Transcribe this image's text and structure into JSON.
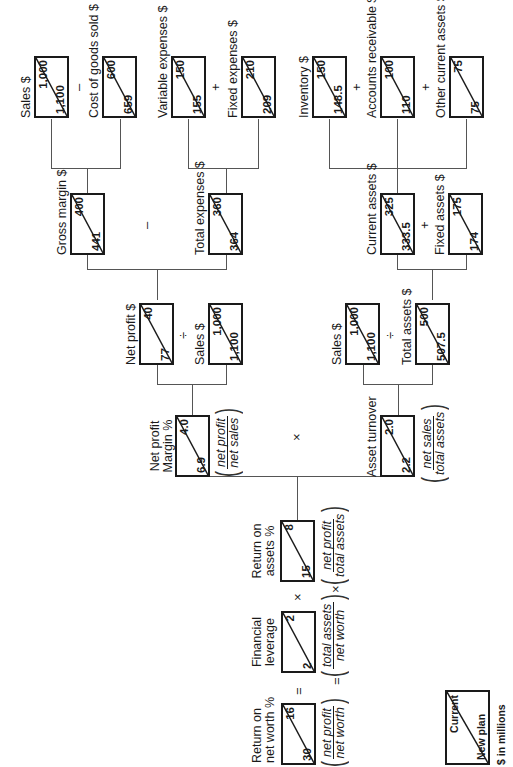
{
  "diagram": {
    "legend": {
      "new_plan": "New plan",
      "current": "Current",
      "units": "$ in millions"
    },
    "nodes": {
      "roe": {
        "label1": "Return on",
        "label2": "net worth %",
        "new_plan": "30",
        "current": "16",
        "formula_num": "net profit",
        "formula_den": "net worth"
      },
      "leverage": {
        "label1": "Financial",
        "label2": "leverage",
        "new_plan": "2",
        "current": "2",
        "formula_num": "total assets",
        "formula_den": "net worth"
      },
      "roa": {
        "label1": "Return on",
        "label2": "assets %",
        "new_plan": "15",
        "current": "8",
        "formula_num": "net profit",
        "formula_den": "total assets"
      },
      "npm": {
        "label1": "Net profit",
        "label2": "Margin %",
        "new_plan": "6.9",
        "current": "4.0",
        "formula_num": "net profit",
        "formula_den": "net sales"
      },
      "asset_turnover": {
        "label": "Asset turnover",
        "new_plan": "2.2",
        "current": "2.0",
        "formula_num": "net sales",
        "formula_den": "total assets"
      },
      "net_profit": {
        "label": "Net profit $",
        "new_plan": "77",
        "current": "40"
      },
      "sales_np": {
        "label": "Sales $",
        "new_plan": "1,100",
        "current": "1,000"
      },
      "sales_at": {
        "label": "Sales $",
        "new_plan": "1,100",
        "current": "1,000"
      },
      "total_assets": {
        "label": "Total assets $",
        "new_plan": "507.5",
        "current": "500"
      },
      "gross_margin": {
        "label": "Gross margin $",
        "new_plan": "441",
        "current": "400"
      },
      "total_expenses": {
        "label": "Total expenses $",
        "new_plan": "364",
        "current": "360"
      },
      "current_assets": {
        "label": "Current assets $",
        "new_plan": "333.5",
        "current": "325"
      },
      "fixed_assets": {
        "label": "Fixed assets $",
        "new_plan": "174",
        "current": "175"
      },
      "sales_gm": {
        "label": "Sales $",
        "new_plan": "1,100",
        "current": "1,000"
      },
      "cogs": {
        "label": "Cost of goods sold $",
        "new_plan": "659",
        "current": "600"
      },
      "variable_expenses": {
        "label": "Variable expenses $",
        "new_plan": "155",
        "current": "150"
      },
      "fixed_expenses": {
        "label": "Fixed expenses $",
        "new_plan": "209",
        "current": "210"
      },
      "inventory": {
        "label": "Inventory $",
        "new_plan": "148.5",
        "current": "150"
      },
      "accounts_receivable": {
        "label": "Accounts receivable $",
        "new_plan": "110",
        "current": "100"
      },
      "other_current_assets": {
        "label": "Other current assets $",
        "new_plan": "75",
        "current": "75"
      }
    },
    "operators": {
      "equals": "=",
      "times": "×",
      "divide": "÷",
      "minus": "–",
      "plus": "+"
    }
  }
}
